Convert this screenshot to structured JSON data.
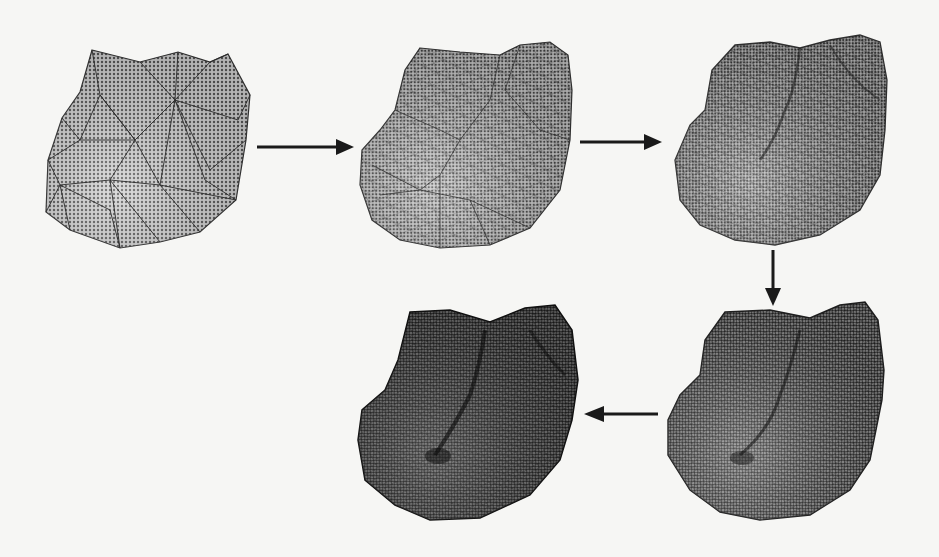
{
  "figure": {
    "type": "mesh-refinement-sequence",
    "colors": {
      "background": "#f6f6f4",
      "mesh_fill_light": "#b8b8b8",
      "mesh_fill_dark": "#4a4a4a",
      "edge": "#222222",
      "arrow": "#1a1a1a"
    },
    "stages": [
      {
        "id": 1,
        "label": "coarse-mesh",
        "density": "low",
        "x": 45,
        "y": 48,
        "w": 205,
        "h": 200
      },
      {
        "id": 2,
        "label": "refined-mesh-1",
        "density": "medium",
        "x": 358,
        "y": 45,
        "w": 215,
        "h": 205
      },
      {
        "id": 3,
        "label": "refined-mesh-2",
        "density": "high",
        "x": 672,
        "y": 35,
        "w": 225,
        "h": 210
      },
      {
        "id": 4,
        "label": "refined-mesh-3",
        "density": "very-high",
        "x": 665,
        "y": 300,
        "w": 225,
        "h": 225
      },
      {
        "id": 5,
        "label": "finest-mesh",
        "density": "finest",
        "x": 355,
        "y": 300,
        "w": 230,
        "h": 225
      }
    ],
    "arrows": [
      {
        "from": 1,
        "to": 2,
        "direction": "right"
      },
      {
        "from": 2,
        "to": 3,
        "direction": "right"
      },
      {
        "from": 3,
        "to": 4,
        "direction": "down"
      },
      {
        "from": 4,
        "to": 5,
        "direction": "left"
      }
    ]
  }
}
